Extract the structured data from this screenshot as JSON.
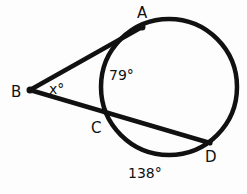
{
  "diagram": {
    "type": "geometry-circle-tangent-secant",
    "points": {
      "A": {
        "label": "A",
        "role": "tangent point on circle"
      },
      "B": {
        "label": "B",
        "role": "external vertex"
      },
      "C": {
        "label": "C",
        "role": "near intersection of secant with circle"
      },
      "D": {
        "label": "D",
        "role": "far intersection of secant with circle"
      }
    },
    "angle_label": "x°",
    "arc_labels": {
      "arc_AC": "79°",
      "arc_AD": "138°"
    },
    "colors": {
      "stroke": "#111111",
      "background": "#fdfdfd"
    }
  }
}
